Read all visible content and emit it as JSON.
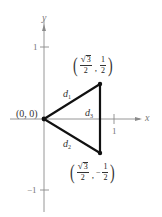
{
  "axes": {
    "x_label": "x",
    "y_label": "y",
    "x_ticks": [
      {
        "value": 1,
        "label": "1"
      }
    ],
    "y_ticks": [
      {
        "value": 1,
        "label": "1"
      },
      {
        "value": -1,
        "label": "−1"
      }
    ]
  },
  "points": {
    "origin": {
      "label": "(0, 0)",
      "x": 0,
      "y": 0
    },
    "top": {
      "x_num_radicand": "3",
      "x_den": "2",
      "y_sign": "",
      "y_num": "1",
      "y_den": "2",
      "comma": ","
    },
    "bottom": {
      "x_num_radicand": "3",
      "x_den": "2",
      "y_sign": "−",
      "y_num": "1",
      "y_den": "2",
      "comma": ","
    }
  },
  "segments": {
    "d1": {
      "letter": "d",
      "index": "1"
    },
    "d2": {
      "letter": "d",
      "index": "2"
    },
    "d3": {
      "letter": "d",
      "index": "3"
    }
  },
  "colors": {
    "axis": "#888888",
    "triangle": "#111111",
    "text": "#333333"
  }
}
